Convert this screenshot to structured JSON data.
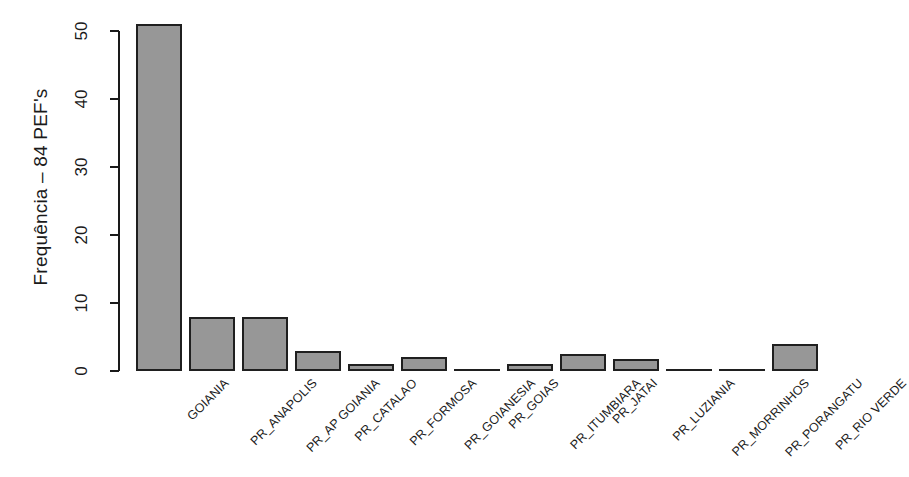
{
  "chart_data": {
    "type": "bar",
    "title": "",
    "xlabel": "",
    "ylabel": "Frequência – 84 PEF's",
    "ylim": [
      0,
      51
    ],
    "yticks": [
      0,
      10,
      20,
      30,
      40,
      50
    ],
    "grid": false,
    "legend": null,
    "bar_color": "#979797",
    "bar_border_color": "#1f1f1f",
    "axis_color": "#1a1a1a",
    "background": "#ffffff",
    "categories": [
      "GOIANIA",
      "PR_ANAPOLIS",
      "PR_AP GOIANIA",
      "PR_CATALAO",
      "PR_FORMOSA",
      "PR_GOIANESIA",
      "PR_GOIAS",
      "PR_ITUMBIARA",
      "PR_JATAI",
      "PR_LUZIANIA",
      "PR_MORRINHOS",
      "PR_PORANGATU",
      "PR_RIO VERDE"
    ],
    "values": [
      51,
      8,
      8,
      3,
      1,
      2,
      0,
      1,
      2.5,
      1.8,
      0,
      0,
      4
    ]
  },
  "axis": {
    "y_title": "Frequência – 84 PEF's",
    "tick_labels": [
      "0",
      "10",
      "20",
      "30",
      "40",
      "50"
    ]
  },
  "bars": [
    {
      "label": "GOIANIA",
      "value": 51
    },
    {
      "label": "PR_ANAPOLIS",
      "value": 8
    },
    {
      "label": "PR_AP GOIANIA",
      "value": 8
    },
    {
      "label": "PR_CATALAO",
      "value": 3
    },
    {
      "label": "PR_FORMOSA",
      "value": 1
    },
    {
      "label": "PR_GOIANESIA",
      "value": 2
    },
    {
      "label": "PR_GOIAS",
      "value": 0
    },
    {
      "label": "PR_ITUMBIARA",
      "value": 1
    },
    {
      "label": "PR_JATAI",
      "value": 2.5
    },
    {
      "label": "PR_LUZIANIA",
      "value": 1.8
    },
    {
      "label": "PR_MORRINHOS",
      "value": 0
    },
    {
      "label": "PR_PORANGATU",
      "value": 0
    },
    {
      "label": "PR_RIO VERDE",
      "value": 4
    }
  ]
}
